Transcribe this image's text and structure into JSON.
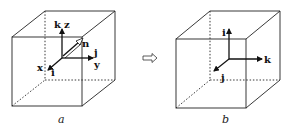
{
  "figure": {
    "panel_a": {
      "caption": "a",
      "labels": {
        "k": "k",
        "z": "z",
        "n": "n",
        "j": "j",
        "y": "y",
        "x": "x",
        "i": "i"
      }
    },
    "transition_arrow": "hollow-right-arrow",
    "panel_b": {
      "caption": "b",
      "labels": {
        "i": "i",
        "k": "k",
        "j": "j"
      }
    },
    "colors": {
      "line": "#111111",
      "background": "#ffffff"
    }
  }
}
